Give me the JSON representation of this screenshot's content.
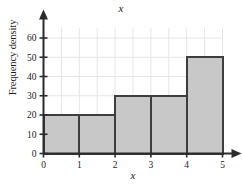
{
  "chart_data": {
    "type": "bar",
    "title": "x",
    "xlabel": "x",
    "ylabel": "Frequency density",
    "categories": [
      "0-1",
      "1-2",
      "2-3",
      "3-4",
      "4-5"
    ],
    "bins": [
      {
        "x0": 0,
        "x1": 1,
        "value": 20
      },
      {
        "x0": 1,
        "x1": 2,
        "value": 20
      },
      {
        "x0": 2,
        "x1": 3,
        "value": 30
      },
      {
        "x0": 3,
        "x1": 4,
        "value": 30
      },
      {
        "x0": 4,
        "x1": 5,
        "value": 50
      }
    ],
    "values": [
      20,
      20,
      30,
      30,
      50
    ],
    "xlim": [
      0,
      5
    ],
    "ylim": [
      0,
      65
    ],
    "xticks": [
      0,
      1,
      2,
      3,
      4,
      5
    ],
    "yticks": [
      0,
      10,
      20,
      30,
      40,
      50,
      60
    ],
    "xtick_labels": [
      "0",
      "1",
      "2",
      "3",
      "4",
      "5"
    ],
    "ytick_labels": [
      "0",
      "10",
      "20",
      "30",
      "40",
      "50",
      "60"
    ],
    "grid": true,
    "grid_x_step": 0.5,
    "grid_y_step": 10,
    "legend": null,
    "colors": {
      "bar_fill": "#c8c8c8",
      "bar_edge": "#3d3d3d",
      "axis": "#2b2b2b",
      "grid": "#e4e4e4",
      "text": "#1a1a1a",
      "background": "#ffffff"
    }
  }
}
